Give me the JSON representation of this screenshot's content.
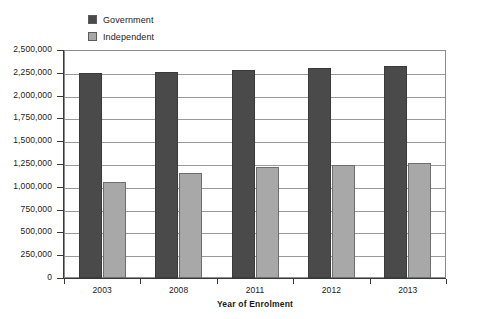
{
  "chart_data": {
    "type": "bar",
    "title": "",
    "xlabel": "Year of Enrolment",
    "ylabel": "",
    "categories": [
      "2003",
      "2008",
      "2011",
      "2012",
      "2013"
    ],
    "series": [
      {
        "name": "Government",
        "color": "#4a4a4a",
        "values": [
          2250000,
          2255000,
          2285000,
          2305000,
          2330000
        ]
      },
      {
        "name": "Independent",
        "color": "#a8a8a8",
        "values": [
          1050000,
          1150000,
          1215000,
          1240000,
          1265000
        ]
      }
    ],
    "ylim": [
      0,
      2500000
    ],
    "ytick_step": 250000,
    "ytick_labels": [
      "2,500,000",
      "2,250,000",
      "2,000,000",
      "1,750,000",
      "1,500,000",
      "1,250,000",
      "1,000,000",
      "750,000",
      "500,000",
      "250,000",
      "0"
    ],
    "grid": true,
    "legend_position": "top-left"
  },
  "legend": {
    "items": [
      {
        "label": "Government",
        "color": "#4a4a4a"
      },
      {
        "label": "Independent",
        "color": "#a8a8a8"
      }
    ]
  },
  "axis": {
    "x_title": "Year of Enrolment"
  }
}
